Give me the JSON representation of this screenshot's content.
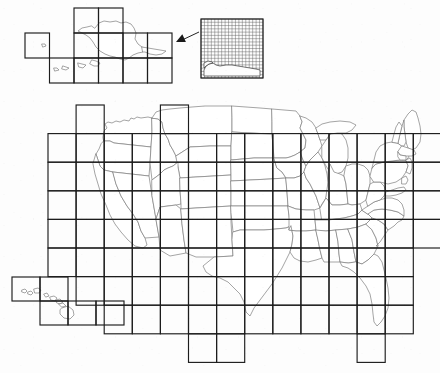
{
  "figure": {
    "background_color": "#fdfdfd",
    "state_border_color": "#7e7e7e",
    "grid_line_color": "#1d1d1d",
    "inset_grid_color": "#5b5b5b",
    "pointer_color": "#1a1a1a"
  },
  "panels": {
    "alaska": {
      "name": "Alaska inset",
      "grid_origin_x": 25,
      "grid_origin_y": 8,
      "cell_width": 24.5,
      "cell_height": 25,
      "cells": [
        [
          2,
          0
        ],
        [
          3,
          0
        ],
        [
          0,
          1
        ],
        [
          2,
          1
        ],
        [
          3,
          1
        ],
        [
          4,
          1
        ],
        [
          5,
          1
        ],
        [
          1,
          2
        ],
        [
          2,
          2
        ],
        [
          3,
          2
        ],
        [
          4,
          2
        ],
        [
          5,
          2
        ]
      ]
    },
    "conus": {
      "name": "Contiguous United States",
      "grid_origin_x": 48,
      "grid_origin_y": 105,
      "cell_width": 28.1,
      "cell_height": 28.6,
      "columns": 14,
      "rows": 9
    },
    "hawaii": {
      "name": "Hawaii inset",
      "grid_origin_x": 12,
      "grid_origin_y": 277,
      "cell_width": 28,
      "cell_height": 24,
      "cells": [
        [
          0,
          0
        ],
        [
          1,
          0
        ],
        [
          1,
          1
        ],
        [
          2,
          1
        ],
        [
          3,
          1
        ]
      ]
    },
    "detail_inset": {
      "name": "Fine grid detail box",
      "x": 201,
      "y": 19,
      "width": 62,
      "height": 59,
      "fine_columns": 18,
      "fine_rows": 18
    },
    "pointer": {
      "name": "Arrow from detail inset to Alaska",
      "from_x": 199,
      "from_y": 32,
      "to_x": 176,
      "to_y": 42
    }
  },
  "chart_data": {
    "type": "map",
    "projection": "Albers-like equal area (conterminous US) with displaced Alaska and Hawaii insets",
    "regions": [
      "Contiguous United States",
      "Alaska",
      "Hawaii"
    ],
    "overlay": "uniform rectangular sampling grid",
    "grid_cell_count_conus": 86,
    "grid_cell_count_alaska": 12,
    "grid_cell_count_hawaii": 5,
    "legend": [],
    "annotations": [
      "arrow linking magnified fine-grid detail box to the Alaska inset"
    ]
  }
}
